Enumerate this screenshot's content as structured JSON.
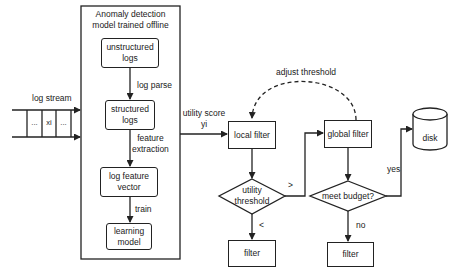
{
  "diagram": {
    "offline_panel": {
      "title_line1": "Anomaly detection",
      "title_line2": "model trained offline",
      "nodes": [
        {
          "id": "unstructured_logs",
          "line1": "unstructured",
          "line2": "logs"
        },
        {
          "id": "structured_logs",
          "line1": "structured",
          "line2": "logs"
        },
        {
          "id": "log_feature_vector",
          "line1": "log feature",
          "line2": "vector"
        },
        {
          "id": "learning_model",
          "line1": "learning",
          "line2": "model"
        }
      ],
      "edges": [
        {
          "from": "unstructured_logs",
          "to": "structured_logs",
          "label": "log parse"
        },
        {
          "from": "structured_logs",
          "to": "log_feature_vector",
          "label_line1": "feature",
          "label_line2": "extraction"
        },
        {
          "from": "log_feature_vector",
          "to": "learning_model",
          "label": "train"
        }
      ]
    },
    "log_stream": {
      "label": "log stream",
      "cells": [
        "...",
        "xi",
        "..."
      ]
    },
    "utility_score": {
      "line1": "utility score",
      "line2": "yi"
    },
    "local_filter": {
      "label": "local filter"
    },
    "utility_threshold": {
      "line1": "utility",
      "line2": "threshold",
      "gt_label": ">",
      "lt_label": "<"
    },
    "filter_left": {
      "label": "filter"
    },
    "global_filter": {
      "label": "global filter"
    },
    "adjust_threshold": {
      "label": "adjust threshold"
    },
    "meet_budget": {
      "label": "meet budget?",
      "yes_label": "yes",
      "no_label": "no"
    },
    "filter_right": {
      "label": "filter"
    },
    "disk": {
      "label": "disk"
    }
  }
}
